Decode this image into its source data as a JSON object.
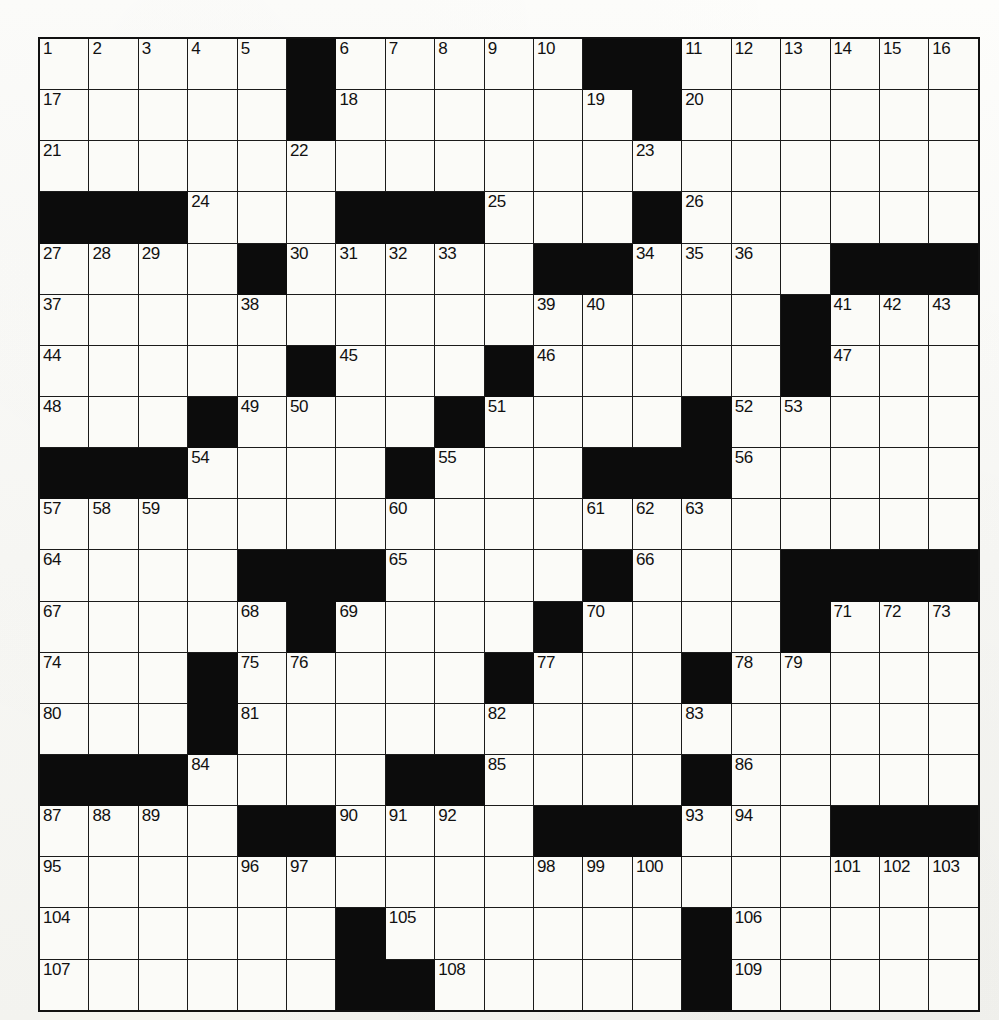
{
  "puzzle": {
    "title": "Crossword Puzzle Grid",
    "columns": 19,
    "rows": 19,
    "colors": {
      "block": "#0c0c0c",
      "cell": "#fbfbf8",
      "border": "#1b1b1b",
      "paper": "#f7f7f4",
      "number_text": "#111111"
    },
    "clue_number_range": {
      "first": 1,
      "last": 109
    },
    "total_clue_numbers": 109,
    "grid": [
      {
        "row": 1,
        "blocks": [
          6,
          12,
          13
        ],
        "numbers": {
          "1": 1,
          "2": 2,
          "3": 3,
          "4": 4,
          "5": 5,
          "7": 6,
          "8": 7,
          "9": 8,
          "10": 9,
          "11": 10,
          "14": 11,
          "15": 12,
          "16": 13,
          "17": 14,
          "18": 15,
          "19": 16
        }
      },
      {
        "row": 2,
        "blocks": [
          6,
          13
        ],
        "numbers": {
          "1": 17,
          "7": 18,
          "12": 19,
          "14": 20
        }
      },
      {
        "row": 3,
        "blocks": [],
        "numbers": {
          "1": 21,
          "6": 22,
          "13": 23
        }
      },
      {
        "row": 4,
        "blocks": [
          1,
          2,
          3,
          7,
          8,
          9,
          13
        ],
        "numbers": {
          "4": 24,
          "10": 25,
          "14": 26
        }
      },
      {
        "row": 5,
        "blocks": [
          5,
          11,
          12,
          17,
          18,
          19
        ],
        "numbers": {
          "1": 27,
          "2": 28,
          "3": 29,
          "6": 30,
          "7": 31,
          "8": 32,
          "9": 33,
          "13": 34,
          "14": 35,
          "15": 36
        }
      },
      {
        "row": 6,
        "blocks": [
          16
        ],
        "numbers": {
          "1": 37,
          "5": 38,
          "11": 39,
          "12": 40,
          "17": 41,
          "18": 42,
          "19": 43
        }
      },
      {
        "row": 7,
        "blocks": [
          6,
          10,
          16
        ],
        "numbers": {
          "1": 44,
          "7": 45,
          "11": 46,
          "17": 47
        }
      },
      {
        "row": 8,
        "blocks": [
          4,
          9,
          14
        ],
        "numbers": {
          "1": 48,
          "5": 49,
          "6": 50,
          "10": 51,
          "15": 52,
          "16": 53
        }
      },
      {
        "row": 9,
        "blocks": [
          1,
          2,
          3,
          8,
          12,
          13,
          14
        ],
        "numbers": {
          "4": 54,
          "9": 55,
          "15": 56
        }
      },
      {
        "row": 10,
        "blocks": [],
        "numbers": {
          "1": 57,
          "2": 58,
          "3": 59,
          "8": 60,
          "12": 61,
          "13": 62,
          "14": 63
        }
      },
      {
        "row": 11,
        "blocks": [
          5,
          6,
          7,
          12,
          16,
          17,
          18,
          19
        ],
        "numbers": {
          "1": 64,
          "8": 65,
          "13": 66
        }
      },
      {
        "row": 12,
        "blocks": [
          6,
          11,
          16
        ],
        "numbers": {
          "1": 67,
          "5": 68,
          "7": 69,
          "12": 70,
          "17": 71,
          "18": 72,
          "19": 73
        }
      },
      {
        "row": 13,
        "blocks": [
          4,
          10,
          14
        ],
        "numbers": {
          "1": 74,
          "5": 75,
          "6": 76,
          "11": 77,
          "15": 78,
          "16": 79
        }
      },
      {
        "row": 14,
        "blocks": [
          4
        ],
        "numbers": {
          "1": 80,
          "5": 81,
          "10": 82,
          "14": 83
        }
      },
      {
        "row": 15,
        "blocks": [
          1,
          2,
          3,
          8,
          9,
          14
        ],
        "numbers": {
          "4": 84,
          "10": 85,
          "15": 86
        }
      },
      {
        "row": 16,
        "blocks": [
          5,
          6,
          11,
          12,
          13,
          17,
          18,
          19
        ],
        "numbers": {
          "1": 87,
          "2": 88,
          "3": 89,
          "7": 90,
          "8": 91,
          "9": 92,
          "14": 93,
          "15": 94
        }
      },
      {
        "row": 17,
        "blocks": [],
        "numbers": {
          "1": 95,
          "5": 96,
          "6": 97,
          "11": 98,
          "12": 99,
          "13": 100,
          "17": 101,
          "18": 102,
          "19": 103
        }
      },
      {
        "row": 18,
        "blocks": [
          7,
          14
        ],
        "numbers": {
          "1": 104,
          "8": 105,
          "15": 106
        }
      },
      {
        "row": 19,
        "blocks": [
          7,
          8,
          14
        ],
        "numbers": {
          "1": 107,
          "9": 108,
          "15": 109
        }
      }
    ]
  }
}
